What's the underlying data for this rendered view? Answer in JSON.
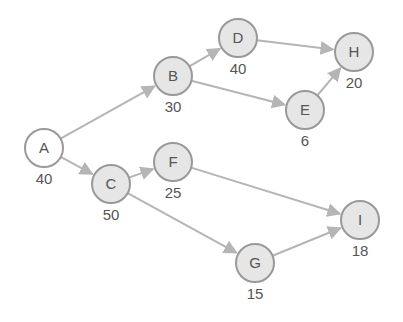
{
  "diagram": {
    "type": "directed-graph",
    "colors": {
      "edge": "#b5b5b5",
      "node_stroke": "#999999",
      "node_fill": "#e6e6e6",
      "start_fill": "#ffffff",
      "text": "#555555"
    },
    "nodes": [
      {
        "id": "A",
        "label": "A",
        "weight": "40",
        "x": 44,
        "y": 148,
        "start": true
      },
      {
        "id": "B",
        "label": "B",
        "weight": "30",
        "x": 173,
        "y": 76
      },
      {
        "id": "D",
        "label": "D",
        "weight": "40",
        "x": 238,
        "y": 38
      },
      {
        "id": "H",
        "label": "H",
        "weight": "20",
        "x": 354,
        "y": 52
      },
      {
        "id": "E",
        "label": "E",
        "weight": "6",
        "x": 305,
        "y": 110
      },
      {
        "id": "C",
        "label": "C",
        "weight": "50",
        "x": 111,
        "y": 184
      },
      {
        "id": "F",
        "label": "F",
        "weight": "25",
        "x": 173,
        "y": 162
      },
      {
        "id": "G",
        "label": "G",
        "weight": "15",
        "x": 255,
        "y": 263
      },
      {
        "id": "I",
        "label": "I",
        "weight": "18",
        "x": 360,
        "y": 220
      }
    ],
    "edges": [
      {
        "from": "A",
        "to": "B"
      },
      {
        "from": "A",
        "to": "C"
      },
      {
        "from": "B",
        "to": "D"
      },
      {
        "from": "B",
        "to": "E"
      },
      {
        "from": "D",
        "to": "H"
      },
      {
        "from": "E",
        "to": "H"
      },
      {
        "from": "C",
        "to": "F"
      },
      {
        "from": "C",
        "to": "G"
      },
      {
        "from": "F",
        "to": "I"
      },
      {
        "from": "G",
        "to": "I"
      }
    ]
  }
}
